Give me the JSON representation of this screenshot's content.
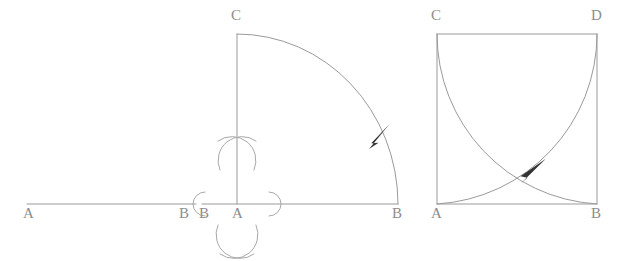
{
  "figure": {
    "background_color": "#ffffff",
    "line_color": "#9a9a9a",
    "arrow_color": "#333333",
    "label_color": "#8d8d8d"
  },
  "panels": [
    {
      "id": "panel-1",
      "name": "line-segment-ab",
      "description": "A straight horizontal line segment labelled A at left end and B at right end",
      "labels": [
        {
          "text": "A",
          "x": 23,
          "y": 206
        },
        {
          "text": "B",
          "x": 179,
          "y": 206
        }
      ],
      "geometry": {
        "segment": {
          "x1": 27,
          "y1": 204,
          "x2": 196,
          "y2": 204
        }
      }
    },
    {
      "id": "panel-2",
      "name": "quarter-arc-with-bisector",
      "description": "Vertical line AC and horizontal line AB meeting at A, quarter circle arc from C to B with direction arrow, plus compass construction marks for the perpendicular bisector",
      "labels": [
        {
          "text": "C",
          "x": 231,
          "y": 8
        },
        {
          "text": "B",
          "x": 199,
          "y": 206
        },
        {
          "text": "A",
          "x": 232,
          "y": 206
        },
        {
          "text": "B",
          "x": 392,
          "y": 206
        }
      ],
      "geometry": {
        "vertex": {
          "x": 237,
          "y": 204
        },
        "vertical_top": {
          "x": 237,
          "y": 34
        },
        "horizontal_left": {
          "x": 202,
          "y": 204
        },
        "horizontal_right": {
          "x": 398,
          "y": 204
        },
        "arc_radius_x": 161,
        "arc_radius_y": 170,
        "arrow_position": {
          "x": 380,
          "y": 132
        }
      }
    },
    {
      "id": "panel-3",
      "name": "square-with-two-arcs",
      "description": "Square ACDB with two intersecting quarter-circle arcs: one centred at C from A to D, one centred at D from C to B, with a direction arrow on the first arc",
      "labels": [
        {
          "text": "C",
          "x": 431,
          "y": 8
        },
        {
          "text": "D",
          "x": 591,
          "y": 8
        },
        {
          "text": "A",
          "x": 431,
          "y": 206
        },
        {
          "text": "B",
          "x": 591,
          "y": 206
        }
      ],
      "geometry": {
        "square": {
          "left": 437,
          "top": 34,
          "right": 597,
          "bottom": 204
        },
        "arrow_position": {
          "x": 533,
          "y": 168
        }
      }
    }
  ]
}
